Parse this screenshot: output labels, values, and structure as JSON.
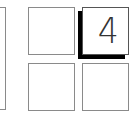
{
  "keypad": {
    "keys": [
      {
        "id": "partial-left",
        "label": "",
        "state": "normal"
      },
      {
        "id": "top-left",
        "label": "",
        "state": "normal"
      },
      {
        "id": "top-right",
        "label": "4",
        "state": "raised"
      },
      {
        "id": "bottom-left",
        "label": "",
        "state": "normal"
      },
      {
        "id": "bottom-right",
        "label": "",
        "state": "normal"
      }
    ]
  },
  "colors": {
    "border": "#8a8a8a",
    "shadow": "#000000",
    "label": "#333333",
    "background": "#ffffff"
  }
}
